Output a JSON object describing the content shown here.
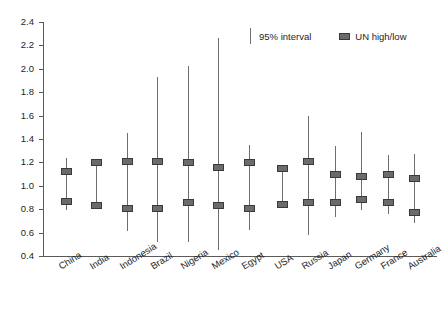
{
  "chart_data": {
    "type": "scatter",
    "title": "",
    "xlabel": "",
    "ylabel": "",
    "ylim": [
      0.4,
      2.4
    ],
    "ytick_step": 0.2,
    "yticks": [
      "2.4",
      "2.2",
      "2.0",
      "1.8",
      "1.6",
      "1.4",
      "1.2",
      "1.0",
      "0.8",
      "0.6",
      "0.4"
    ],
    "grid": false,
    "legend_position": "top-right",
    "legend": [
      {
        "key": "ci",
        "label": "95% interval",
        "marker": "vertical-line",
        "color": "#6e6e6e"
      },
      {
        "key": "un",
        "label": "UN high/low",
        "marker": "square",
        "color": "#6b6b6b"
      }
    ],
    "groups": [
      {
        "name": "group-left",
        "categories": [
          "China",
          "India",
          "Indonesia",
          "Brazil",
          "Nigeria",
          "Mexico",
          "Egypt"
        ]
      },
      {
        "name": "group-right",
        "categories": [
          "USA",
          "Russia",
          "Japan",
          "Germany",
          "France",
          "Australia"
        ]
      }
    ],
    "categories": [
      "China",
      "India",
      "Indonesia",
      "Brazil",
      "Nigeria",
      "Mexico",
      "Egypt",
      "USA",
      "Russia",
      "Japan",
      "Germany",
      "France",
      "Australia"
    ],
    "series": [
      {
        "name": "95% interval",
        "type": "range",
        "lower": [
          0.79,
          0.83,
          0.61,
          0.52,
          0.52,
          0.45,
          0.62,
          0.81,
          0.58,
          0.73,
          0.79,
          0.76,
          0.68
        ],
        "upper": [
          1.24,
          1.2,
          1.45,
          1.93,
          2.02,
          2.26,
          1.35,
          1.18,
          1.6,
          1.34,
          1.46,
          1.26,
          1.27
        ]
      },
      {
        "name": "UN high/low",
        "type": "markers",
        "high": [
          1.12,
          1.2,
          1.21,
          1.21,
          1.2,
          1.16,
          1.2,
          1.15,
          1.21,
          1.1,
          1.08,
          1.1,
          1.06
        ],
        "low": [
          0.87,
          0.83,
          0.81,
          0.81,
          0.86,
          0.83,
          0.81,
          0.84,
          0.86,
          0.86,
          0.88,
          0.86,
          0.77
        ]
      }
    ]
  },
  "top_caption": ""
}
